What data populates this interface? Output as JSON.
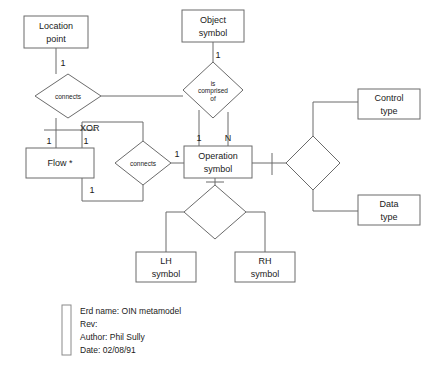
{
  "diagram": {
    "kind": "entity-relationship-diagram",
    "title": "OIN metamodel",
    "entities": [
      {
        "id": "location-point",
        "lines": [
          "Location",
          "point"
        ],
        "x": 24,
        "y": 16,
        "w": 64,
        "h": 32
      },
      {
        "id": "object-symbol",
        "lines": [
          "Object",
          "symbol"
        ],
        "x": 182,
        "y": 10,
        "w": 62,
        "h": 32
      },
      {
        "id": "control-type",
        "lines": [
          "Control",
          "type"
        ],
        "x": 358,
        "y": 89,
        "w": 62,
        "h": 30
      },
      {
        "id": "flow",
        "lines": [
          "Flow *"
        ],
        "x": 26,
        "y": 148,
        "w": 68,
        "h": 30
      },
      {
        "id": "operation-symbol",
        "lines": [
          "Operation",
          "symbol"
        ],
        "x": 184,
        "y": 146,
        "w": 68,
        "h": 32
      },
      {
        "id": "data-type",
        "lines": [
          "Data",
          "type"
        ],
        "x": 358,
        "y": 195,
        "w": 62,
        "h": 30
      },
      {
        "id": "lh-symbol",
        "lines": [
          "LH",
          "symbol"
        ],
        "x": 136,
        "y": 252,
        "w": 60,
        "h": 30
      },
      {
        "id": "rh-symbol",
        "lines": [
          "RH",
          "symbol"
        ],
        "x": 235,
        "y": 252,
        "w": 60,
        "h": 30
      }
    ],
    "relationships": [
      {
        "id": "connects-location-flow",
        "lines": [
          "connects"
        ],
        "cx": 68,
        "cy": 96,
        "rx": 33,
        "ry": 22
      },
      {
        "id": "is-comprised-of",
        "lines": [
          "is",
          "comprised",
          "of"
        ],
        "cx": 213,
        "cy": 90,
        "rx": 30,
        "ry": 28
      },
      {
        "id": "connects-flow-operation",
        "lines": [
          "connects"
        ],
        "cx": 143,
        "cy": 163,
        "rx": 28,
        "ry": 22
      },
      {
        "id": "operation-types",
        "lines": [],
        "cx": 313,
        "cy": 163,
        "rx": 27,
        "ry": 27
      },
      {
        "id": "operation-hands",
        "lines": [],
        "cx": 215,
        "cy": 212,
        "rx": 31,
        "ry": 27
      }
    ],
    "cardinalities": [
      {
        "id": "card-location-connects",
        "text": "1",
        "x": 63,
        "y": 66
      },
      {
        "id": "card-object-comprised",
        "text": "1",
        "x": 218,
        "y": 58
      },
      {
        "id": "card-comprised-left",
        "text": "1",
        "x": 199,
        "y": 141
      },
      {
        "id": "card-comprised-right",
        "text": "N",
        "x": 228,
        "y": 141
      },
      {
        "id": "card-flow-xor-left",
        "text": "1",
        "x": 49,
        "y": 144
      },
      {
        "id": "card-flow-xor-right",
        "text": "1",
        "x": 86,
        "y": 144
      },
      {
        "id": "card-flow-connects",
        "text": "1",
        "x": 92,
        "y": 193
      },
      {
        "id": "card-operation-connects",
        "text": "1",
        "x": 177,
        "y": 157
      }
    ],
    "constraints": [
      {
        "id": "xor-constraint",
        "text": "XOR",
        "x": 80,
        "y": 131
      }
    ],
    "connectors": [
      {
        "id": "location-to-connects",
        "path": "M 56 48 L 56 74"
      },
      {
        "id": "connects-to-xor-bar",
        "path": "M 56 118 L 56 130"
      },
      {
        "id": "xor-bar",
        "path": "M 44 130 L 96 130"
      },
      {
        "id": "xor-left-leg",
        "path": "M 56 130 L 56 148"
      },
      {
        "id": "xor-right-leg",
        "path": "M 82 130 L 82 148"
      },
      {
        "id": "xor-right-to-connects2",
        "path": "M 82 130 L 82 122 L 143 122 L 143 141"
      },
      {
        "id": "flow-bottom-to-connects2",
        "path": "M 82 178 L 82 201 L 143 201 L 143 185"
      },
      {
        "id": "connects2-to-operation",
        "path": "M 171 163 L 184 163"
      },
      {
        "id": "connects1-to-comprised",
        "path": "M 101 96 L 183 96"
      },
      {
        "id": "object-to-comprised",
        "path": "M 213 42 L 213 62"
      },
      {
        "id": "comprised-left-to-operation",
        "path": "M 199 110 L 199 128 L 199 146"
      },
      {
        "id": "comprised-right-to-operation",
        "path": "M 228 112 L 228 146"
      },
      {
        "id": "operation-to-typesdiamond",
        "path": "M 252 163 L 286 163"
      },
      {
        "id": "typesdiamond-to-control",
        "path": "M 313 136 L 313 102 L 358 102"
      },
      {
        "id": "typesdiamond-to-data",
        "path": "M 313 190 L 313 211 L 358 211"
      },
      {
        "id": "operation-to-handsdiamond",
        "path": "M 215 178 L 215 185"
      },
      {
        "id": "handsdiamond-to-lh",
        "path": "M 184 212 L 166 212 L 166 252"
      },
      {
        "id": "handsdiamond-to-rh",
        "path": "M 246 212 L 265 212 L 265 252"
      }
    ],
    "ticks": [
      {
        "id": "tick-operation-right",
        "path": "M 272 153 L 272 175"
      },
      {
        "id": "tick-operation-bottom",
        "path": "M 206 182 L 224 182"
      }
    ],
    "legend": {
      "bar": {
        "x": 62,
        "y": 305,
        "w": 9,
        "h": 50
      },
      "lines": [
        "Erd name: OIN metamodel",
        "Rev:",
        "Author: Phil Sully",
        "Date: 02/08/91"
      ]
    },
    "colors": {
      "stroke": "#6b6b6b",
      "text": "#1a1a1a",
      "background": "#ffffff"
    }
  }
}
